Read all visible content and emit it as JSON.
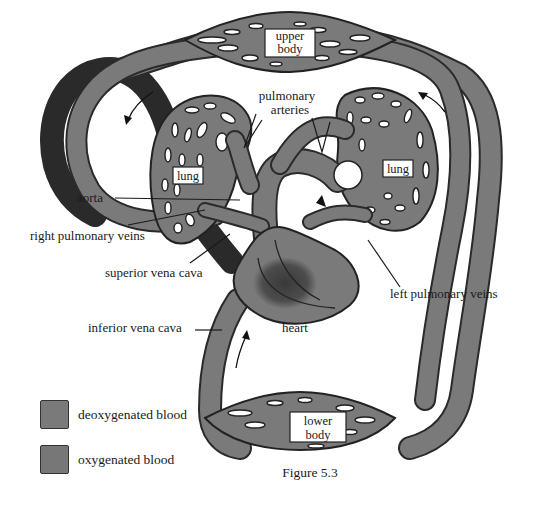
{
  "figure": {
    "caption": "Figure 5.3",
    "colors": {
      "deoxygenated": "#7a7a7a",
      "oxygenated": "#7a7a7a",
      "vessel_outline": "#2a2a2a",
      "heart_dark": "#3a3a3a",
      "background": "#ffffff"
    }
  },
  "labels": {
    "upper_body_1": "upper",
    "upper_body_2": "body",
    "lower_body_1": "lower",
    "lower_body_2": "body",
    "lung_left": "lung",
    "lung_right": "lung",
    "pulmonary_arteries_1": "pulmonary",
    "pulmonary_arteries_2": "arteries",
    "aorta": "aorta",
    "right_pulmonary_veins": "right pulmonary veins",
    "superior_vena_cava": "superior vena cava",
    "left_pulmonary_veins": "left pulmonary veins",
    "inferior_vena_cava": "inferior vena cava",
    "heart": "heart"
  },
  "legend": {
    "items": [
      {
        "label": "deoxygenated blood",
        "color": "#7a7a7a"
      },
      {
        "label": "oxygenated blood",
        "color": "#777777"
      }
    ]
  }
}
